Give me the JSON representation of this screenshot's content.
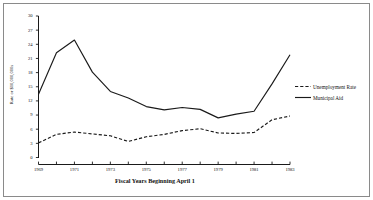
{
  "chart_data": {
    "type": "line",
    "title": "",
    "xlabel": "Fiscal Years Beginning April 1",
    "ylabel": "Rate or $10,000,000s",
    "x": [
      1969,
      1970,
      1971,
      1972,
      1973,
      1974,
      1975,
      1976,
      1977,
      1978,
      1979,
      1980,
      1981,
      1982,
      1983
    ],
    "xlim": [
      1969,
      1983
    ],
    "ylim": [
      0,
      30
    ],
    "xticks": [
      1969,
      1971,
      1973,
      1975,
      1977,
      1979,
      1981,
      1983
    ],
    "xtick_labels": [
      "1969",
      "1971",
      "1973",
      "1975",
      "1977",
      "1979",
      "1981",
      "1983"
    ],
    "yticks": [
      0,
      3,
      6,
      9,
      12,
      15,
      18,
      21,
      24,
      27,
      30
    ],
    "ytick_labels": [
      "0",
      "3",
      "6",
      "9",
      "12",
      "15",
      "18",
      "21",
      "24",
      "27",
      "30"
    ],
    "grid": false,
    "legend_position": "right",
    "series": [
      {
        "name": "Unemployment Rate",
        "style": "dashed",
        "color": "#1a1a1a",
        "values": [
          3.1,
          4.9,
          5.4,
          5.0,
          4.6,
          3.4,
          4.4,
          4.9,
          5.7,
          6.1,
          5.2,
          5.1,
          5.3,
          8.0,
          8.8
        ]
      },
      {
        "name": "Municipal Aid",
        "style": "solid",
        "color": "#1a1a1a",
        "values": [
          13.4,
          22.2,
          24.9,
          18.1,
          14.0,
          12.6,
          10.8,
          10.1,
          10.6,
          10.2,
          8.4,
          9.2,
          9.8,
          15.6,
          21.8
        ]
      }
    ]
  },
  "legend": {
    "entries": [
      {
        "label": "Unemployment Rate",
        "style": "dashed"
      },
      {
        "label": "Municipal Aid",
        "style": "solid"
      }
    ]
  }
}
